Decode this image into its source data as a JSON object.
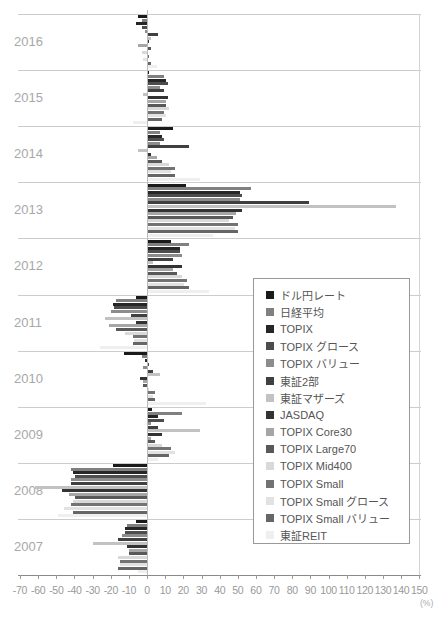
{
  "chart_data": {
    "type": "bar",
    "orientation": "horizontal",
    "title": "",
    "xlabel": "(%)",
    "ylabel": "",
    "xlim": [
      -70,
      150
    ],
    "x_ticks": [
      -70,
      -60,
      -50,
      -40,
      -30,
      -20,
      -10,
      0,
      10,
      20,
      30,
      40,
      50,
      60,
      70,
      80,
      90,
      100,
      110,
      120,
      130,
      140,
      150
    ],
    "unit_label": "(%)",
    "grid": "horizontal band separators, right edge line, zero axis line",
    "legend_position": "middle-right box",
    "years": [
      "2016",
      "2015",
      "2014",
      "2013",
      "2012",
      "2011",
      "2010",
      "2009",
      "2008",
      "2007"
    ],
    "series": [
      {
        "id": "dollar-yen",
        "name": "ドル円レート",
        "color": "#1a1a1a",
        "values": [
          -5,
          0.5,
          14,
          21,
          13,
          -6,
          -13,
          2.5,
          -19,
          -6
        ]
      },
      {
        "id": "nikkei",
        "name": "日経平均",
        "color": "#808080",
        "values": [
          -3,
          9,
          7,
          57,
          23,
          -17,
          -3,
          19,
          -42,
          -11
        ]
      },
      {
        "id": "topix",
        "name": "TOPIX",
        "color": "#262626",
        "values": [
          -6,
          10,
          8,
          51,
          18,
          -19,
          -1,
          5.5,
          -41,
          -12
        ]
      },
      {
        "id": "topix-growth",
        "name": "TOPIX グロース",
        "color": "#4d4d4d",
        "values": [
          -3,
          11,
          9,
          52,
          18,
          -18,
          1,
          9,
          -40,
          -12
        ]
      },
      {
        "id": "topix-value",
        "name": "TOPIX バリュー",
        "color": "#8c8c8c",
        "values": [
          -1,
          7,
          7,
          51,
          19,
          -20,
          -2,
          2,
          -42,
          -14
        ]
      },
      {
        "id": "tse-2nd",
        "name": "東証2部",
        "color": "#404040",
        "values": [
          6,
          9,
          23,
          89,
          14,
          -9,
          3,
          6,
          -42,
          -16
        ]
      },
      {
        "id": "mothers",
        "name": "東証マザーズ",
        "color": "#c2c2c2",
        "values": [
          2,
          -2,
          -5,
          137,
          3,
          -23,
          7,
          29,
          -62,
          -30
        ]
      },
      {
        "id": "jasdaq",
        "name": "JASDAQ",
        "color": "#333333",
        "values": [
          1,
          11,
          2,
          52,
          19,
          -6,
          -4,
          8,
          -47,
          -11
        ]
      },
      {
        "id": "topix-core30",
        "name": "TOPIX Core30",
        "color": "#a6a6a6",
        "values": [
          -5,
          10,
          5,
          49,
          14,
          -21,
          -2,
          2,
          -43,
          -10
        ]
      },
      {
        "id": "topix-large70",
        "name": "TOPIX Large70",
        "color": "#595959",
        "values": [
          2,
          10,
          8,
          47,
          16,
          -17,
          -2,
          4,
          -40,
          -10
        ]
      },
      {
        "id": "topix-mid400",
        "name": "TOPIX Mid400",
        "color": "#d9d9d9",
        "values": [
          -3,
          12,
          12,
          45,
          19,
          -12,
          1,
          8,
          -41,
          -16
        ]
      },
      {
        "id": "topix-small",
        "name": "TOPIX Small",
        "color": "#737373",
        "values": [
          1,
          9,
          15,
          50,
          22,
          -8,
          4,
          13,
          -42,
          -15
        ]
      },
      {
        "id": "topix-small-growth",
        "name": "TOPIX Small グロース",
        "color": "#e2e2e2",
        "values": [
          -2,
          10,
          13,
          48,
          20,
          -7,
          3,
          15,
          -46,
          -15
        ]
      },
      {
        "id": "topix-small-value",
        "name": "TOPIX Small バリュー",
        "color": "#666666",
        "values": [
          2,
          8,
          15,
          50,
          23,
          -8,
          4,
          12,
          -41,
          -16
        ]
      },
      {
        "id": "tse-reit",
        "name": "東証REIT",
        "color": "#efefef",
        "values": [
          5,
          -8,
          29,
          36,
          34,
          -26,
          32,
          6,
          -49,
          -5
        ]
      }
    ]
  },
  "layout_note": "annual return bar chart by year 2007-2016, Japanese market segments"
}
